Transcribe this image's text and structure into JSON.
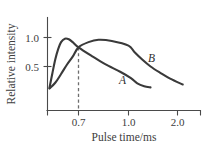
{
  "chart_data": {
    "type": "line",
    "title": "",
    "xlabel": "Pulse time/ms",
    "ylabel": "Relative intensity",
    "xticks": [
      "0.7",
      "1.0",
      "2.0"
    ],
    "xtick_values": [
      0.7,
      1.0,
      2.0
    ],
    "yticks": [
      "1.0",
      "0.5"
    ],
    "ytick_values": [
      1.0,
      0.5
    ],
    "xlim": [
      0.38,
      2.22
    ],
    "ylim": [
      0.0,
      1.22
    ],
    "grid": false,
    "legend": "inline-curve-labels",
    "annotations": [
      {
        "name": "intersection-dashed-line",
        "type": "vline",
        "x": 0.7,
        "y_top": 0.83,
        "style": "dashed",
        "label": "0.7"
      }
    ],
    "series": [
      {
        "name": "A",
        "label": "A",
        "color": "#3a3a3a",
        "peak_x": 0.57,
        "peak_y": 0.98,
        "points": [
          [
            0.4,
            0.13
          ],
          [
            0.43,
            0.38
          ],
          [
            0.46,
            0.62
          ],
          [
            0.49,
            0.8
          ],
          [
            0.52,
            0.92
          ],
          [
            0.56,
            0.98
          ],
          [
            0.6,
            0.97
          ],
          [
            0.64,
            0.92
          ],
          [
            0.7,
            0.83
          ],
          [
            0.78,
            0.68
          ],
          [
            0.86,
            0.54
          ],
          [
            0.95,
            0.41
          ],
          [
            1.05,
            0.3
          ],
          [
            1.18,
            0.21
          ],
          [
            1.32,
            0.16
          ],
          [
            1.45,
            0.14
          ]
        ]
      },
      {
        "name": "B",
        "label": "B",
        "color": "#3a3a3a",
        "peak_x": 0.82,
        "peak_y": 0.96,
        "points": [
          [
            0.4,
            0.12
          ],
          [
            0.46,
            0.22
          ],
          [
            0.52,
            0.37
          ],
          [
            0.58,
            0.53
          ],
          [
            0.64,
            0.67
          ],
          [
            0.7,
            0.83
          ],
          [
            0.76,
            0.92
          ],
          [
            0.82,
            0.96
          ],
          [
            0.9,
            0.94
          ],
          [
            1.0,
            0.86
          ],
          [
            1.12,
            0.75
          ],
          [
            1.28,
            0.62
          ],
          [
            1.45,
            0.5
          ],
          [
            1.65,
            0.39
          ],
          [
            1.85,
            0.29
          ],
          [
            2.05,
            0.19
          ]
        ]
      }
    ]
  },
  "labels": {
    "ylabel": "Relative intensity",
    "xlabel": "Pulse time/ms",
    "ytick_1": "1.0",
    "ytick_2": "0.5",
    "xtick_1": "0.7",
    "xtick_2": "1.0",
    "xtick_3": "2.0",
    "curve_a": "A",
    "curve_b": "B"
  },
  "colors": {
    "curve": "#3a3a3a",
    "axis": "#4a4a4a",
    "dashed": "#6e6e6e",
    "text": "#3d3d3d",
    "background": "#ffffff"
  }
}
